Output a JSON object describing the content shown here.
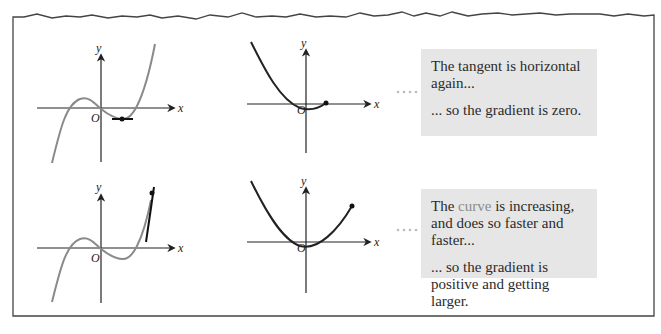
{
  "figure": {
    "colors": {
      "frame": "#444444",
      "function_curve": "#8a8a8a",
      "derivative_curve": "#222222",
      "tangent": "#111111",
      "axis": "#222222",
      "note_background": "#e6e6e6",
      "note_text": "#2b2b2b",
      "highlight_word": "#8c8c8c",
      "connector_dots": "#bbbbbb"
    },
    "rows": [
      {
        "function_graph": {
          "axis_x_label": "x",
          "axis_y_label": "y",
          "origin_label": "O",
          "curve": "cubic",
          "tangent": "horizontal at local minimum"
        },
        "gradient_graph": {
          "axis_x_label": "x",
          "axis_y_label": "y",
          "origin_label": "O",
          "curve": "parabola, traced up to point on x-axis"
        },
        "note": {
          "line1": "The tangent is horizontal again...",
          "line2": "... so the gradient is zero."
        }
      },
      {
        "function_graph": {
          "axis_x_label": "x",
          "axis_y_label": "y",
          "origin_label": "O",
          "curve": "cubic",
          "tangent": "steep positive slope"
        },
        "gradient_graph": {
          "axis_x_label": "x",
          "axis_y_label": "y",
          "origin_label": "O",
          "curve": "parabola, traced up to high positive point"
        },
        "note": {
          "line1_pre": "The ",
          "line1_highlight": "curve",
          "line1_post": " is increasing, and does so faster and faster...",
          "line2": "... so the gradient is positive and getting larger."
        }
      }
    ]
  }
}
